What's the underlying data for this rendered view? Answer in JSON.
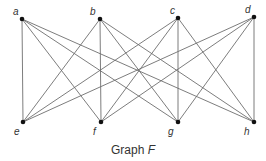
{
  "graph": {
    "name": "Graph F",
    "type": "complete bipartite K4,4",
    "nodes": [
      {
        "id": "a",
        "label": "a",
        "x": 22,
        "y": 19,
        "lx": 13,
        "ly": 15
      },
      {
        "id": "b",
        "label": "b",
        "x": 100,
        "y": 19,
        "lx": 90,
        "ly": 15
      },
      {
        "id": "c",
        "label": "c",
        "x": 178,
        "y": 18,
        "lx": 170,
        "ly": 14
      },
      {
        "id": "d",
        "label": "d",
        "x": 254,
        "y": 17,
        "lx": 245,
        "ly": 13
      },
      {
        "id": "e",
        "label": "e",
        "x": 23,
        "y": 122,
        "lx": 14,
        "ly": 135
      },
      {
        "id": "f",
        "label": "f",
        "x": 101,
        "y": 122,
        "lx": 93,
        "ly": 135
      },
      {
        "id": "g",
        "label": "g",
        "x": 178,
        "y": 122,
        "lx": 168,
        "ly": 135
      },
      {
        "id": "h",
        "label": "h",
        "x": 254,
        "y": 122,
        "lx": 244,
        "ly": 135
      }
    ],
    "edges": [
      [
        "a",
        "e"
      ],
      [
        "a",
        "f"
      ],
      [
        "a",
        "g"
      ],
      [
        "a",
        "h"
      ],
      [
        "b",
        "e"
      ],
      [
        "b",
        "f"
      ],
      [
        "b",
        "g"
      ],
      [
        "b",
        "h"
      ],
      [
        "c",
        "e"
      ],
      [
        "c",
        "f"
      ],
      [
        "c",
        "g"
      ],
      [
        "c",
        "h"
      ],
      [
        "d",
        "e"
      ],
      [
        "d",
        "f"
      ],
      [
        "d",
        "g"
      ],
      [
        "d",
        "h"
      ]
    ]
  },
  "caption": {
    "prefix": "Graph ",
    "variable": "F"
  },
  "colors": {
    "edge": "#6e6e6e",
    "node": "#111111",
    "text": "#333333"
  }
}
